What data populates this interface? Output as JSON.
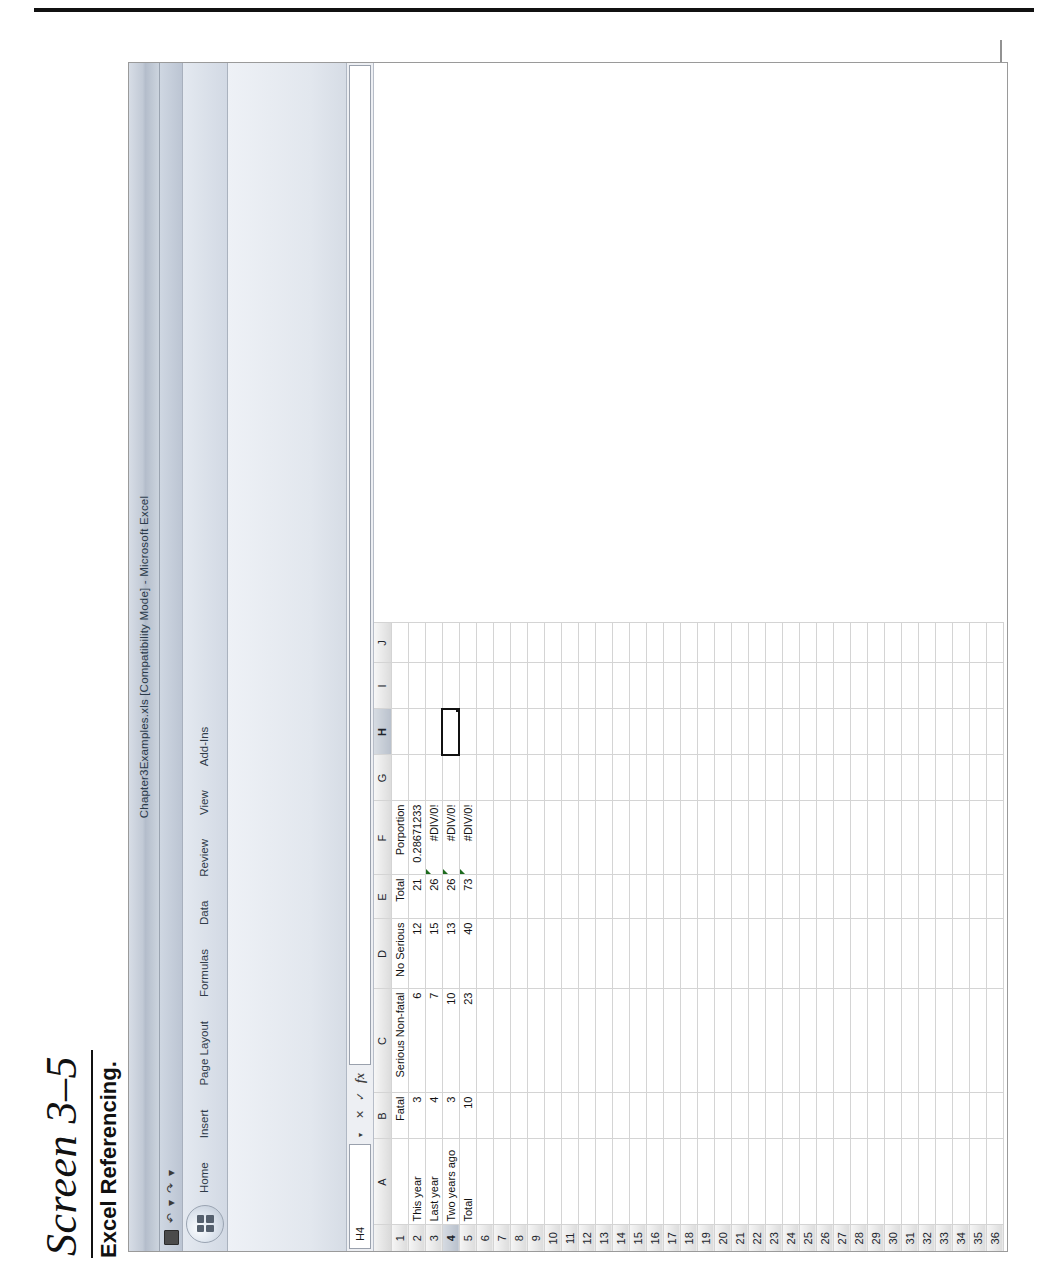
{
  "page": {
    "screen_label": "Screen 3–5",
    "caption": "Excel Referencing."
  },
  "window": {
    "title": "Chapter3Examples.xls [Compatibility Mode] - Microsoft Excel",
    "office_button": "office-orb",
    "quick_access": [
      {
        "name": "save-icon",
        "glyph": "■"
      },
      {
        "name": "undo-icon",
        "glyph": "↶"
      },
      {
        "name": "undo-dropdown-icon",
        "glyph": "▾"
      },
      {
        "name": "redo-icon",
        "glyph": "↷"
      },
      {
        "name": "customize-qat-icon",
        "glyph": "▾"
      }
    ]
  },
  "ribbon": {
    "tabs": [
      {
        "label": "Home",
        "active": false
      },
      {
        "label": "Insert",
        "active": false
      },
      {
        "label": "Page Layout",
        "active": false
      },
      {
        "label": "Formulas",
        "active": false
      },
      {
        "label": "Data",
        "active": false
      },
      {
        "label": "Review",
        "active": false
      },
      {
        "label": "View",
        "active": false
      },
      {
        "label": "Add-Ins",
        "active": false
      }
    ]
  },
  "formula_bar": {
    "name_box_value": "H4",
    "name_box_dropdown": "▾",
    "cancel_icon": "✕",
    "enter_icon": "✓",
    "function_icon": "fx",
    "formula_value": ""
  },
  "sheet": {
    "columns": [
      "A",
      "B",
      "C",
      "D",
      "E",
      "F",
      "G",
      "H",
      "I",
      "J"
    ],
    "selected_cell": "H4",
    "selected_column": "H",
    "selected_row": 4,
    "rows": [
      1,
      2,
      3,
      4,
      5,
      6,
      7,
      8,
      9,
      10,
      11,
      12,
      13,
      14,
      15,
      16,
      17,
      18,
      19,
      20,
      21,
      22,
      23,
      24,
      25,
      26,
      27,
      28,
      29,
      30,
      31,
      32,
      33,
      34,
      35,
      36
    ],
    "data": {
      "1": {
        "A": "",
        "B": "Fatal",
        "C": "Serious Non-fatal",
        "D": "No Serious",
        "E": "Total",
        "F": "Porportion"
      },
      "2": {
        "A": "This year",
        "B": "3",
        "C": "6",
        "D": "12",
        "E": "21",
        "F": "0.28671233"
      },
      "3": {
        "A": "Last year",
        "B": "4",
        "C": "7",
        "D": "15",
        "E": "26",
        "F": "#DIV/0!"
      },
      "4": {
        "A": "Two years ago",
        "B": "3",
        "C": "10",
        "D": "13",
        "E": "26",
        "F": "#DIV/0!"
      },
      "5": {
        "A": "Total",
        "B": "10",
        "C": "23",
        "D": "40",
        "E": "73",
        "F": "#DIV/0!"
      }
    },
    "header_row": 1,
    "bold_rows": [
      1,
      5
    ],
    "error_cells": [
      "F3",
      "F4",
      "F5"
    ]
  },
  "colors": {
    "titlebar": "#c2cad6",
    "ribbon": "#e4e9f0",
    "grid_line": "#d4d4d4",
    "header_fill": "#dcdcdc",
    "selection_outline": "#111111",
    "error_flag": "#1d6b1d"
  }
}
